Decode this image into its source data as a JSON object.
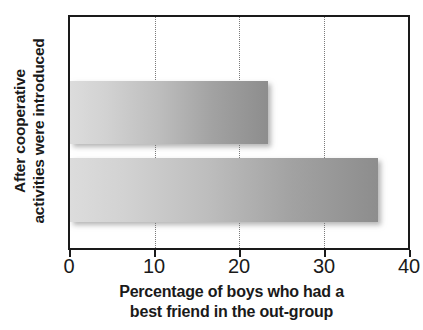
{
  "chart_data": {
    "type": "bar",
    "orientation": "horizontal",
    "title": "",
    "xlabel": "Percentage of boys who had a best friend in the out-group",
    "xlabel_lines": [
      "Percentage of boys who had a",
      "best friend in the out-group"
    ],
    "ylabel": "After cooperative activities were introduced",
    "ylabel_lines": [
      "After cooperative",
      "activities were introduced"
    ],
    "categories": [
      "Before",
      "After"
    ],
    "values": [
      23.4,
      36.4
    ],
    "bars": [
      {
        "name": "top-bar",
        "value": 23.4
      },
      {
        "name": "bottom-bar",
        "value": 36.4
      }
    ],
    "xlim": [
      0,
      40
    ],
    "xticks": [
      0,
      10,
      20,
      30,
      40
    ],
    "xtick_labels": [
      "0",
      "10",
      "20",
      "30",
      "40"
    ],
    "gridlines": [
      10,
      20,
      30
    ],
    "grid": true,
    "legend": null,
    "colors": {
      "bar_gradient_start": "#dcdcdc",
      "bar_gradient_end": "#8d8d8d",
      "axis": "#1a1a1a",
      "gridline": "#7a7a7a",
      "background": "#ffffff"
    }
  },
  "axis": {
    "tick_0": "0",
    "tick_1": "10",
    "tick_2": "20",
    "tick_3": "30",
    "tick_4": "40"
  },
  "xlabel": {
    "line1": "Percentage of boys who had a",
    "line2": "best friend in the out-group"
  },
  "ylabel": {
    "line1": "After cooperative",
    "line2": "activities were introduced"
  }
}
